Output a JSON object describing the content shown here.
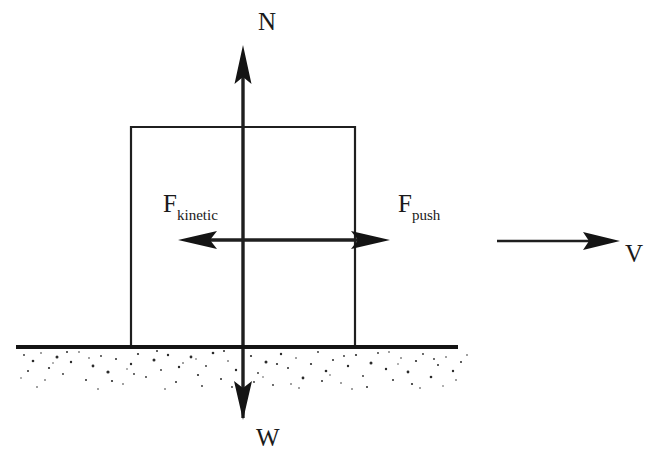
{
  "diagram": {
    "type": "physics-free-body-diagram",
    "canvas": {
      "width": 659,
      "height": 475,
      "background": "#ffffff"
    },
    "ink_color": "#1f1f1f",
    "labels": {
      "normal_force": {
        "text": "N",
        "x": 265,
        "y": 30
      },
      "weight": {
        "text": "W",
        "x": 262,
        "y": 446
      },
      "friction_force_base": {
        "text": "F",
        "sub": "kinetic",
        "x": 163,
        "y": 212
      },
      "push_force_base": {
        "text": "F",
        "sub": "push",
        "x": 398,
        "y": 212
      },
      "velocity": {
        "text": "V",
        "x": 625,
        "y": 262
      }
    },
    "block": {
      "name": "block",
      "left": 130,
      "right": 355,
      "top": 126,
      "bottom": 347
    },
    "ground": {
      "name": "ground-surface",
      "line_y": 347,
      "line_x_start": 16,
      "line_x_end": 458,
      "hatch_top": 350,
      "hatch_bottom": 390,
      "hatch_x_start": 18,
      "hatch_x_end": 470
    },
    "arrows": [
      {
        "name": "normal-force-arrow",
        "label": "N",
        "direction": "up",
        "x": 243,
        "from_y": 240,
        "to_y": 45
      },
      {
        "name": "weight-force-arrow",
        "label": "W",
        "direction": "down",
        "x": 243,
        "from_y": 240,
        "to_y": 420
      },
      {
        "name": "kinetic-friction-arrow",
        "label": "F kinetic",
        "direction": "left",
        "y": 240,
        "from_x": 243,
        "to_x": 178
      },
      {
        "name": "push-force-arrow",
        "label": "F push",
        "direction": "right",
        "y": 240,
        "from_x": 243,
        "to_x": 390
      },
      {
        "name": "velocity-arrow",
        "label": "V",
        "direction": "right",
        "y": 241,
        "from_x": 497,
        "to_x": 620
      }
    ]
  }
}
